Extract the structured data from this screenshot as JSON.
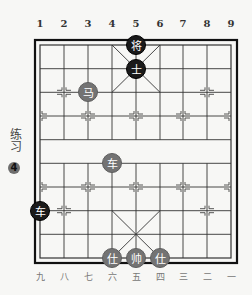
{
  "board": {
    "columns_top": [
      "1",
      "2",
      "3",
      "4",
      "5",
      "6",
      "7",
      "8",
      "9"
    ],
    "columns_bottom": [
      "九",
      "八",
      "七",
      "六",
      "五",
      "四",
      "三",
      "二",
      "一"
    ],
    "rows": 10,
    "cols": 9,
    "colors": {
      "line": "#333333",
      "frame": "#111111",
      "background": "#f7f7f5",
      "black_piece": "#1a1a1a",
      "red_piece": "#737373"
    }
  },
  "exercise": {
    "label": "练习",
    "number": "4"
  },
  "pieces": [
    {
      "side": "black",
      "char": "将",
      "name": "black-general",
      "col": 5,
      "row": 1
    },
    {
      "side": "black",
      "char": "士",
      "name": "black-advisor",
      "col": 5,
      "row": 2
    },
    {
      "side": "red",
      "char": "马",
      "name": "red-horse",
      "col": 3,
      "row": 3
    },
    {
      "side": "red",
      "char": "车",
      "name": "red-chariot",
      "col": 4,
      "row": 6
    },
    {
      "side": "black",
      "char": "车",
      "name": "black-chariot",
      "col": 1,
      "row": 8
    },
    {
      "side": "red",
      "char": "仕",
      "name": "red-advisor-left",
      "col": 4,
      "row": 10
    },
    {
      "side": "red",
      "char": "帅",
      "name": "red-general",
      "col": 5,
      "row": 10
    },
    {
      "side": "red",
      "char": "仕",
      "name": "red-advisor-right",
      "col": 6,
      "row": 10
    }
  ]
}
